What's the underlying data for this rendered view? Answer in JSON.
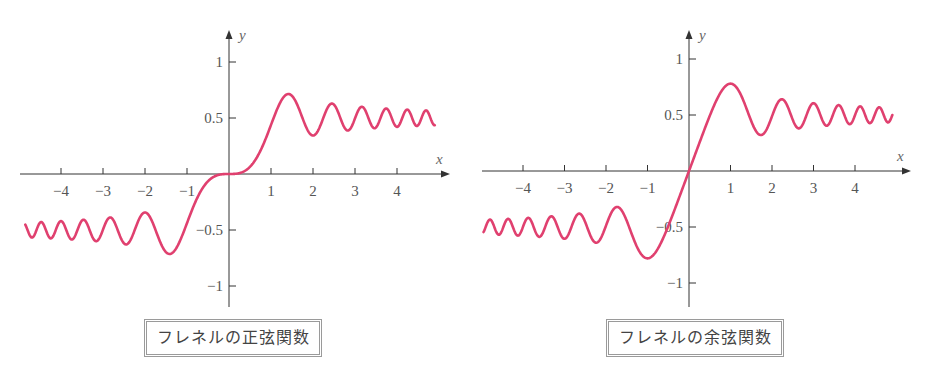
{
  "chart_data": [
    {
      "type": "line",
      "title": "フレネルの正弦関数",
      "function": "S(x)",
      "xlabel": "x",
      "ylabel": "y",
      "xlim": [
        -4.8,
        4.9
      ],
      "ylim": [
        -1.2,
        1.2
      ],
      "x_ticks": [
        -4,
        -3,
        -2,
        -1,
        1,
        2,
        3,
        4
      ],
      "x_tick_labels": [
        "−4",
        "−3",
        "−2",
        "−1",
        "1",
        "2",
        "3",
        "4"
      ],
      "y_ticks": [
        1,
        0.5,
        -0.5,
        -1
      ],
      "y_tick_labels": [
        "1",
        "0.5",
        "−0.5",
        "−1"
      ],
      "grid": false,
      "series": [
        {
          "name": "フレネルの正弦関数",
          "color": "#e0406f",
          "x": [
            -4.8,
            -4,
            -3,
            -2,
            -1.41,
            -1,
            0,
            1,
            1.41,
            2,
            2.45,
            3,
            4,
            4.8
          ],
          "values": [
            -0.48,
            -0.42,
            -0.5,
            -0.34,
            -0.71,
            -0.44,
            0,
            0.44,
            0.71,
            0.34,
            0.63,
            0.5,
            0.42,
            0.5
          ]
        }
      ]
    },
    {
      "type": "line",
      "title": "フレネルの余弦関数",
      "function": "C(x)",
      "xlabel": "x",
      "ylabel": "y",
      "xlim": [
        -4.8,
        4.9
      ],
      "ylim": [
        -1.2,
        1.2
      ],
      "x_ticks": [
        -4,
        -3,
        -2,
        -1,
        1,
        2,
        3,
        4
      ],
      "x_tick_labels": [
        "−4",
        "−3",
        "−2",
        "−1",
        "1",
        "2",
        "3",
        "4"
      ],
      "y_ticks": [
        1,
        0.5,
        -0.5,
        -1
      ],
      "y_tick_labels": [
        "1",
        "0.5",
        "−0.5",
        "−1"
      ],
      "grid": false,
      "series": [
        {
          "name": "フレネルの余弦関数",
          "color": "#e0406f",
          "x": [
            -4.8,
            -4,
            -3,
            -2.24,
            -1.73,
            -1,
            0,
            1,
            1.73,
            2.24,
            3,
            4,
            4.8
          ],
          "values": [
            -0.56,
            -0.5,
            -0.61,
            -0.37,
            -0.32,
            -0.78,
            0,
            0.78,
            0.32,
            0.63,
            0.61,
            0.5,
            0.56
          ]
        }
      ]
    }
  ],
  "panels": [
    {
      "caption": "フレネルの正弦関数",
      "x_axis_label": "x",
      "y_axis_label": "y"
    },
    {
      "caption": "フレネルの余弦関数",
      "x_axis_label": "x",
      "y_axis_label": "y"
    }
  ]
}
